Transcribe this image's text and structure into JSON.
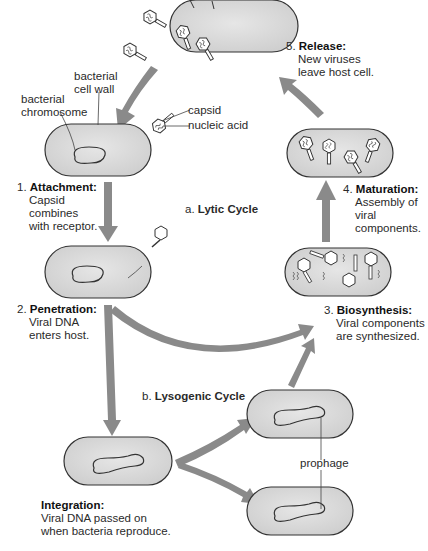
{
  "colors": {
    "cell_fill": "#d9d9d9",
    "cell_stroke": "#333333",
    "arrow_fill": "#8a8a8a",
    "text": "#222222"
  },
  "labels": {
    "cell_wall": [
      "bacterial",
      "cell wall"
    ],
    "chromosome": [
      "bacterial",
      "chromosome"
    ],
    "capsid": "capsid",
    "nucleic_acid": "nucleic acid",
    "prophage": "prophage"
  },
  "cycles": {
    "lytic": {
      "prefix": "a.",
      "title": "Lytic Cycle"
    },
    "lysogenic": {
      "prefix": "b.",
      "title": "Lysogenic Cycle"
    }
  },
  "steps": [
    {
      "num": "1.",
      "title": "Attachment:",
      "lines": [
        "Capsid",
        "combines",
        "with receptor."
      ]
    },
    {
      "num": "2.",
      "title": "Penetration:",
      "lines": [
        "Viral DNA",
        "enters host."
      ]
    },
    {
      "num": "3.",
      "title": "Biosynthesis:",
      "lines": [
        "Viral components",
        "are synthesized."
      ]
    },
    {
      "num": "4.",
      "title": "Maturation:",
      "lines": [
        "Assembly of",
        "viral",
        "components."
      ]
    },
    {
      "num": "5.",
      "title": "Release:",
      "lines": [
        "New viruses",
        "leave host cell."
      ]
    },
    {
      "num": "",
      "title": "Integration:",
      "lines": [
        "Viral DNA passed on",
        "when bacteria reproduce."
      ]
    }
  ]
}
